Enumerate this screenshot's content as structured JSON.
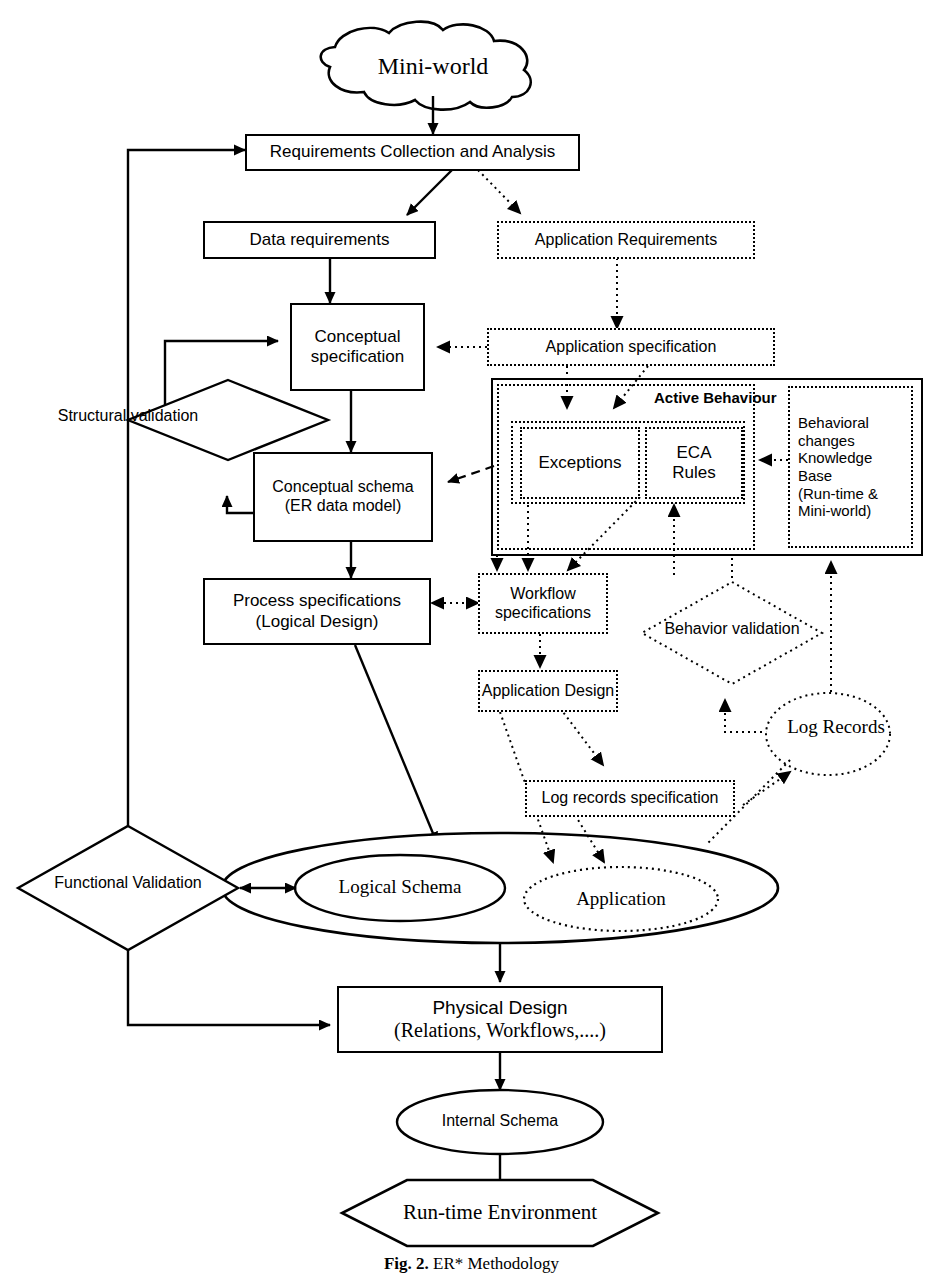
{
  "figure": {
    "caption_bold": "Fig. 2.",
    "caption_rest": " ER* Methodology"
  },
  "nodes": {
    "mini_world": {
      "label": "Mini-world",
      "shape": "cloud",
      "style": "solid"
    },
    "requirements_collection": {
      "label": "Requirements Collection and Analysis",
      "shape": "rect",
      "style": "solid"
    },
    "data_requirements": {
      "label": "Data requirements",
      "shape": "rect",
      "style": "solid"
    },
    "application_requirements": {
      "label": "Application Requirements",
      "shape": "rect",
      "style": "dotted"
    },
    "conceptual_specification": {
      "label_line1": "Conceptual",
      "label_line2": "specification",
      "shape": "rect",
      "style": "solid"
    },
    "application_specification": {
      "label": "Application specification",
      "shape": "rect",
      "style": "dotted"
    },
    "structural_validation": {
      "label_line1": "Structural",
      "label_line2": "validation",
      "shape": "diamond",
      "style": "solid"
    },
    "active_behaviour": {
      "label": "Active Behaviour",
      "shape": "rect",
      "style": "solid"
    },
    "exceptions": {
      "label": "Exceptions",
      "shape": "rect",
      "style": "dotted"
    },
    "eca_rules": {
      "label_line1": "ECA",
      "label_line2": "Rules",
      "shape": "rect",
      "style": "dotted"
    },
    "behavioral_kb": {
      "line1": "Behavioral",
      "line2": "changes",
      "line3": "Knowledge",
      "line4": "Base",
      "line5": "(Run-time &",
      "line6": "Mini-world)",
      "shape": "rect",
      "style": "dotted"
    },
    "conceptual_schema": {
      "label_line1": "Conceptual schema",
      "label_line2": "(ER data model)",
      "shape": "rect",
      "style": "solid"
    },
    "process_specifications": {
      "label_line1": "Process specifications",
      "label_line2": "(Logical Design)",
      "shape": "rect",
      "style": "solid"
    },
    "workflow_specifications": {
      "label_line1": "Workflow",
      "label_line2": "specifications",
      "shape": "rect",
      "style": "dotted"
    },
    "behavior_validation": {
      "label_line1": "Behavior",
      "label_line2": "validation",
      "shape": "diamond",
      "style": "dotted"
    },
    "application_design": {
      "label": "Application Design",
      "shape": "rect",
      "style": "dotted"
    },
    "log_records_specification": {
      "label": "Log records specification",
      "shape": "rect",
      "style": "dotted"
    },
    "log_records": {
      "label_line1": "Log",
      "label_line2": "Records",
      "shape": "ellipse",
      "style": "dotted"
    },
    "functional_validation": {
      "label_line1": "Functional",
      "label_line2": "Validation",
      "shape": "diamond",
      "style": "solid"
    },
    "outer_system_ellipse": {
      "label": "",
      "shape": "ellipse",
      "style": "solid"
    },
    "logical_schema": {
      "label": "Logical Schema",
      "shape": "ellipse",
      "style": "solid"
    },
    "application": {
      "label": "Application",
      "shape": "ellipse",
      "style": "dotted"
    },
    "physical_design": {
      "label_line1": "Physical Design",
      "label_line2": "(Relations, Workflows,....)",
      "shape": "rect",
      "style": "solid"
    },
    "internal_schema": {
      "label": "Internal Schema",
      "shape": "ellipse",
      "style": "solid"
    },
    "runtime_environment": {
      "label": "Run-time Environment",
      "shape": "hexagon",
      "style": "solid"
    }
  },
  "colors": {
    "stroke": "#000000",
    "fill": "#ffffff",
    "background": "#ffffff"
  },
  "edges": [
    {
      "from": "mini_world",
      "to": "requirements_collection",
      "style": "solid"
    },
    {
      "from": "requirements_collection",
      "to": "data_requirements",
      "style": "solid"
    },
    {
      "from": "requirements_collection",
      "to": "application_requirements",
      "style": "dotted"
    },
    {
      "from": "data_requirements",
      "to": "conceptual_specification",
      "style": "solid"
    },
    {
      "from": "application_requirements",
      "to": "application_specification",
      "style": "dotted"
    },
    {
      "from": "application_specification",
      "to": "conceptual_specification",
      "style": "dotted"
    },
    {
      "from": "application_specification",
      "to": "exceptions",
      "style": "dotted"
    },
    {
      "from": "application_specification",
      "to": "eca_rules",
      "style": "dotted"
    },
    {
      "from": "conceptual_specification",
      "to": "conceptual_schema",
      "style": "solid"
    },
    {
      "from": "conceptual_schema",
      "to": "structural_validation",
      "style": "solid"
    },
    {
      "from": "structural_validation",
      "to": "conceptual_specification",
      "style": "solid"
    },
    {
      "from": "eca_rules",
      "to": "conceptual_schema",
      "style": "dashed"
    },
    {
      "from": "behavioral_kb",
      "to": "eca_rules",
      "style": "dotted"
    },
    {
      "from": "conceptual_schema",
      "to": "process_specifications",
      "style": "solid"
    },
    {
      "from": "process_specifications",
      "to": "workflow_specifications",
      "style": "dotted-bidir"
    },
    {
      "from": "workflow_specifications",
      "to": "application_design",
      "style": "dotted"
    },
    {
      "from": "application_design",
      "to": "log_records_specification",
      "style": "dotted"
    },
    {
      "from": "behavior_validation",
      "to": "log_records",
      "style": "dotted"
    },
    {
      "from": "log_records",
      "to": "behavioral_kb",
      "style": "dotted"
    },
    {
      "from": "log_records_specification",
      "to": "log_records",
      "style": "dotted"
    },
    {
      "from": "process_specifications",
      "to": "outer_system_ellipse",
      "style": "solid"
    },
    {
      "from": "functional_validation",
      "to": "outer_system_ellipse",
      "style": "solid-bidir"
    },
    {
      "from": "requirements_collection",
      "to": "functional_validation",
      "style": "solid"
    },
    {
      "from": "functional_validation",
      "to": "physical_design",
      "style": "solid"
    },
    {
      "from": "outer_system_ellipse",
      "to": "physical_design",
      "style": "solid"
    },
    {
      "from": "physical_design",
      "to": "internal_schema",
      "style": "solid"
    },
    {
      "from": "internal_schema",
      "to": "runtime_environment",
      "style": "solid"
    },
    {
      "from": "application_design",
      "to": "application",
      "style": "dotted"
    },
    {
      "from": "log_records_specification",
      "to": "application",
      "style": "dotted"
    }
  ]
}
